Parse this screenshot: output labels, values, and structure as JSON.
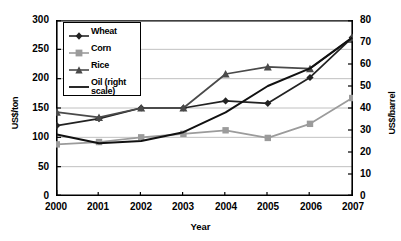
{
  "chart_data": {
    "type": "line",
    "title": "",
    "xlabel": "Year",
    "ylabel": "US$/ton",
    "y2label": "US$/barrel",
    "categories": [
      "2000",
      "2001",
      "2002",
      "2003",
      "2004",
      "2005",
      "2006",
      "2007"
    ],
    "x": [
      2000,
      2001,
      2002,
      2003,
      2004,
      2005,
      2006,
      2007
    ],
    "ylim": [
      0,
      300
    ],
    "y2lim": [
      0,
      80
    ],
    "yticks": [
      0,
      50,
      100,
      150,
      200,
      250,
      300
    ],
    "y2ticks": [
      0,
      10,
      20,
      30,
      40,
      50,
      60,
      70,
      80
    ],
    "grid": true,
    "legend_position": "top-left",
    "series": [
      {
        "name": "Wheat",
        "axis": "left",
        "marker": "diamond",
        "color": "#222222",
        "values": [
          120,
          132,
          150,
          150,
          162,
          158,
          202,
          270
        ]
      },
      {
        "name": "Corn",
        "axis": "left",
        "marker": "square",
        "color": "#9b9b9b",
        "values": [
          88,
          92,
          100,
          106,
          112,
          99,
          123,
          167
        ]
      },
      {
        "name": "Rice",
        "axis": "left",
        "marker": "triangle",
        "color": "#4a4a4a",
        "values": [
          143,
          134,
          150,
          150,
          208,
          220,
          217,
          270
        ]
      },
      {
        "name": "Oil (right scale)",
        "axis": "right",
        "marker": "none",
        "color": "#111111",
        "values": [
          28,
          24,
          25,
          29,
          38,
          50,
          58,
          72
        ]
      }
    ]
  },
  "axes": {
    "left_ticks": [
      "300",
      "250",
      "200",
      "150",
      "100",
      "50",
      "0"
    ],
    "right_ticks": [
      "80",
      "70",
      "60",
      "50",
      "40",
      "30",
      "20",
      "10",
      "0"
    ],
    "x_ticks": [
      "2000",
      "2001",
      "2002",
      "2003",
      "2004",
      "2005",
      "2006",
      "2007"
    ],
    "y_left_title": "US$/ton",
    "y_right_title": "US$/barrel",
    "x_title": "Year"
  },
  "legend": {
    "items": [
      {
        "label": "Wheat"
      },
      {
        "label": "Corn"
      },
      {
        "label": "Rice"
      },
      {
        "label": "Oil (right scale)"
      }
    ]
  }
}
